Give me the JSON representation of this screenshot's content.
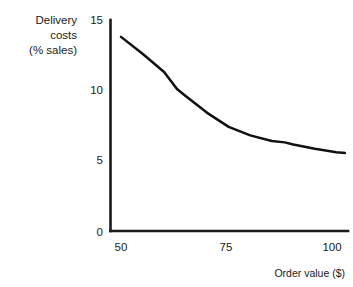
{
  "chart_data": {
    "type": "line",
    "title": "",
    "xlabel": "Order value ($)",
    "ylabel": "Delivery costs (% sales)",
    "ylabel_lines": [
      "Delivery",
      "costs",
      "(% sales)"
    ],
    "xlim": [
      50,
      102
    ],
    "ylim": [
      0,
      15
    ],
    "xticks": [
      50,
      75,
      100
    ],
    "xtick_labels": [
      "50",
      "75",
      "100"
    ],
    "yticks": [
      0,
      5,
      10,
      15
    ],
    "ytick_labels": [
      "0",
      "5",
      "10",
      "15"
    ],
    "grid": false,
    "legend": false,
    "line_color": "#111111",
    "axis_color": "#1a1a1a",
    "series": [
      {
        "name": "Delivery costs",
        "x": [
          50,
          55,
          60,
          63,
          65,
          70,
          75,
          80,
          85,
          88,
          90,
          95,
          100,
          102
        ],
        "values": [
          13.8,
          12.6,
          11.3,
          10.1,
          9.6,
          8.4,
          7.4,
          6.8,
          6.4,
          6.3,
          6.15,
          5.85,
          5.6,
          5.55
        ]
      }
    ]
  },
  "axis": {
    "x_tick_50": "50",
    "x_tick_75": "75",
    "x_tick_100": "100",
    "y_tick_0": "0",
    "y_tick_5": "5",
    "y_tick_10": "10",
    "y_tick_15": "15"
  },
  "labels": {
    "y_line1": "Delivery",
    "y_line2": "costs",
    "y_line3": "(% sales)",
    "x_title": "Order value ($)"
  }
}
